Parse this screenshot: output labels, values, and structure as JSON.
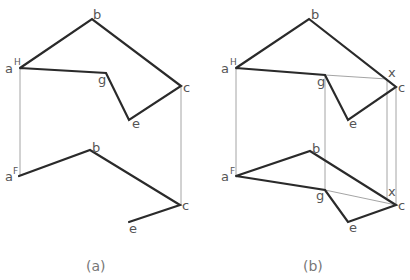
{
  "figure": {
    "panels": [
      {
        "id": "a",
        "caption": "(a)",
        "top_view": {
          "points": {
            "a": [
              20,
              68
            ],
            "b": [
              92,
              19
            ],
            "c": [
              181,
              86
            ],
            "e": [
              129,
              120
            ],
            "g": [
              106,
              73
            ]
          },
          "labels": {
            "a": "a",
            "a_sup": "H",
            "b": "b",
            "c": "c",
            "e": "e",
            "g": "g"
          }
        },
        "front_view": {
          "points": {
            "a": [
              19,
              176
            ],
            "b": [
              90,
              150
            ],
            "c": [
              180,
              205
            ],
            "e": [
              129,
              222
            ]
          },
          "labels": {
            "a": "a",
            "a_sup": "F",
            "b": "b",
            "c": "c",
            "e": "e"
          }
        }
      },
      {
        "id": "b",
        "caption": "(b)",
        "top_view": {
          "points": {
            "a": [
              236,
              68
            ],
            "b": [
              309,
              19
            ],
            "c": [
              396,
              87
            ],
            "e": [
              348,
              120
            ],
            "g": [
              325,
              75
            ],
            "x": [
              387,
              79
            ]
          },
          "labels": {
            "a": "a",
            "a_sup": "H",
            "b": "b",
            "c": "c",
            "e": "e",
            "g": "g",
            "x": "x"
          }
        },
        "front_view": {
          "points": {
            "a": [
              236,
              176
            ],
            "b": [
              310,
              151
            ],
            "c": [
              396,
              205
            ],
            "e": [
              348,
              222
            ],
            "g": [
              325,
              190
            ],
            "x": [
              387,
              198
            ]
          },
          "labels": {
            "a": "a",
            "a_sup": "F",
            "b": "b",
            "c": "c",
            "e": "e",
            "g": "g",
            "x": "x"
          }
        }
      }
    ]
  }
}
